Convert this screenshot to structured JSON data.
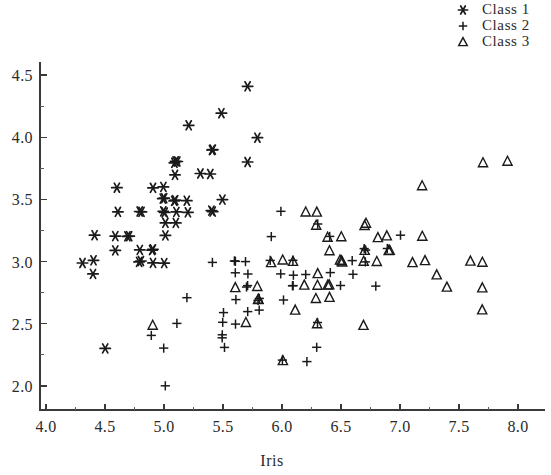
{
  "chart_data": {
    "type": "scatter",
    "title": "",
    "xlabel": "Iris",
    "ylabel": "",
    "xlim": [
      3.9,
      8.25
    ],
    "ylim": [
      1.85,
      4.62
    ],
    "xticks": [
      "4.0",
      "4.5",
      "5.0",
      "5.5",
      "6.0",
      "6.5",
      "7.0",
      "7.5",
      "8.0"
    ],
    "xtick_values": [
      4.0,
      4.5,
      5.0,
      5.5,
      6.0,
      6.5,
      7.0,
      7.5,
      8.0
    ],
    "yticks": [
      "2.0",
      "2.5",
      "3.0",
      "3.5",
      "4.0",
      "4.5"
    ],
    "ytick_values": [
      2.0,
      2.5,
      3.0,
      3.5,
      4.0,
      4.5
    ],
    "minor_tick_step": 0.25,
    "grid": false,
    "legend_position": "top-right",
    "marker_color": "#1a1a1a",
    "background_color": "#ffffff",
    "series": [
      {
        "name": "Class 1",
        "marker": "asterisk",
        "points": [
          [
            5.1,
            3.5
          ],
          [
            4.9,
            3.0
          ],
          [
            4.7,
            3.2
          ],
          [
            4.6,
            3.1
          ],
          [
            5.0,
            3.6
          ],
          [
            5.4,
            3.9
          ],
          [
            4.6,
            3.4
          ],
          [
            5.0,
            3.4
          ],
          [
            4.4,
            2.9
          ],
          [
            4.9,
            3.1
          ],
          [
            5.4,
            3.7
          ],
          [
            4.8,
            3.4
          ],
          [
            4.8,
            3.0
          ],
          [
            4.3,
            3.0
          ],
          [
            5.8,
            4.0
          ],
          [
            5.7,
            4.4
          ],
          [
            5.4,
            3.9
          ],
          [
            5.1,
            3.5
          ],
          [
            5.7,
            3.8
          ],
          [
            5.1,
            3.8
          ],
          [
            5.4,
            3.4
          ],
          [
            5.1,
            3.7
          ],
          [
            4.6,
            3.6
          ],
          [
            5.1,
            3.3
          ],
          [
            4.8,
            3.4
          ],
          [
            5.0,
            3.0
          ],
          [
            5.0,
            3.4
          ],
          [
            5.2,
            3.5
          ],
          [
            5.2,
            3.4
          ],
          [
            4.7,
            3.2
          ],
          [
            4.8,
            3.1
          ],
          [
            5.4,
            3.4
          ],
          [
            5.2,
            4.1
          ],
          [
            5.5,
            4.2
          ],
          [
            4.9,
            3.1
          ],
          [
            5.0,
            3.2
          ],
          [
            5.5,
            3.5
          ],
          [
            4.9,
            3.6
          ],
          [
            4.4,
            3.0
          ],
          [
            5.1,
            3.4
          ],
          [
            5.0,
            3.5
          ],
          [
            4.5,
            2.3
          ],
          [
            4.4,
            3.2
          ],
          [
            5.0,
            3.5
          ],
          [
            5.1,
            3.8
          ],
          [
            4.8,
            3.0
          ],
          [
            5.1,
            3.8
          ],
          [
            4.6,
            3.2
          ],
          [
            5.3,
            3.7
          ],
          [
            5.0,
            3.3
          ]
        ]
      },
      {
        "name": "Class 2",
        "marker": "plus",
        "points": [
          [
            7.0,
            3.2
          ],
          [
            6.4,
            3.2
          ],
          [
            6.9,
            3.1
          ],
          [
            5.5,
            2.3
          ],
          [
            6.5,
            2.8
          ],
          [
            5.7,
            2.8
          ],
          [
            6.3,
            3.3
          ],
          [
            4.9,
            2.4
          ],
          [
            6.6,
            2.9
          ],
          [
            5.2,
            2.7
          ],
          [
            5.0,
            2.0
          ],
          [
            5.9,
            3.0
          ],
          [
            6.0,
            2.2
          ],
          [
            6.1,
            2.9
          ],
          [
            5.6,
            2.9
          ],
          [
            6.7,
            3.1
          ],
          [
            5.6,
            3.0
          ],
          [
            5.8,
            2.7
          ],
          [
            6.2,
            2.2
          ],
          [
            5.6,
            2.5
          ],
          [
            5.9,
            3.2
          ],
          [
            6.1,
            2.8
          ],
          [
            6.3,
            2.5
          ],
          [
            6.1,
            2.8
          ],
          [
            6.4,
            2.9
          ],
          [
            6.6,
            3.0
          ],
          [
            6.8,
            2.8
          ],
          [
            6.7,
            3.0
          ],
          [
            6.0,
            2.9
          ],
          [
            5.7,
            2.6
          ],
          [
            5.5,
            2.4
          ],
          [
            5.5,
            2.4
          ],
          [
            5.8,
            2.7
          ],
          [
            6.0,
            2.7
          ],
          [
            5.4,
            3.0
          ],
          [
            6.0,
            3.4
          ],
          [
            6.7,
            3.1
          ],
          [
            6.3,
            2.3
          ],
          [
            5.6,
            3.0
          ],
          [
            5.5,
            2.5
          ],
          [
            5.5,
            2.6
          ],
          [
            6.1,
            3.0
          ],
          [
            5.8,
            2.6
          ],
          [
            5.0,
            2.3
          ],
          [
            5.6,
            2.7
          ],
          [
            5.7,
            3.0
          ],
          [
            5.7,
            2.9
          ],
          [
            6.2,
            2.9
          ],
          [
            5.1,
            2.5
          ],
          [
            5.7,
            2.8
          ]
        ]
      },
      {
        "name": "Class 3",
        "marker": "triangle",
        "points": [
          [
            6.3,
            3.3
          ],
          [
            5.8,
            2.7
          ],
          [
            7.1,
            3.0
          ],
          [
            6.3,
            2.9
          ],
          [
            6.5,
            3.0
          ],
          [
            7.6,
            3.0
          ],
          [
            4.9,
            2.5
          ],
          [
            7.3,
            2.9
          ],
          [
            6.7,
            2.5
          ],
          [
            7.2,
            3.6
          ],
          [
            6.5,
            3.2
          ],
          [
            6.4,
            2.7
          ],
          [
            6.8,
            3.0
          ],
          [
            5.7,
            2.5
          ],
          [
            5.8,
            2.8
          ],
          [
            6.4,
            3.2
          ],
          [
            6.5,
            3.0
          ],
          [
            7.7,
            3.8
          ],
          [
            7.7,
            2.6
          ],
          [
            6.0,
            2.2
          ],
          [
            6.9,
            3.2
          ],
          [
            5.6,
            2.8
          ],
          [
            7.7,
            2.8
          ],
          [
            6.3,
            2.7
          ],
          [
            6.7,
            3.3
          ],
          [
            7.2,
            3.2
          ],
          [
            6.2,
            2.8
          ],
          [
            6.1,
            3.0
          ],
          [
            6.4,
            2.8
          ],
          [
            7.2,
            3.0
          ],
          [
            7.4,
            2.8
          ],
          [
            7.9,
            3.8
          ],
          [
            6.4,
            2.8
          ],
          [
            6.3,
            2.8
          ],
          [
            6.1,
            2.6
          ],
          [
            7.7,
            3.0
          ],
          [
            6.3,
            3.4
          ],
          [
            6.4,
            3.1
          ],
          [
            6.0,
            3.0
          ],
          [
            6.9,
            3.1
          ],
          [
            6.7,
            3.1
          ],
          [
            6.9,
            3.1
          ],
          [
            5.8,
            2.7
          ],
          [
            6.8,
            3.2
          ],
          [
            6.7,
            3.3
          ],
          [
            6.7,
            3.0
          ],
          [
            6.3,
            2.5
          ],
          [
            6.5,
            3.0
          ],
          [
            6.2,
            3.4
          ],
          [
            5.9,
            3.0
          ]
        ]
      }
    ]
  },
  "legend": {
    "items": [
      {
        "label": "Class 1",
        "marker": "asterisk"
      },
      {
        "label": "Class 2",
        "marker": "plus"
      },
      {
        "label": "Class 3",
        "marker": "triangle"
      }
    ]
  }
}
